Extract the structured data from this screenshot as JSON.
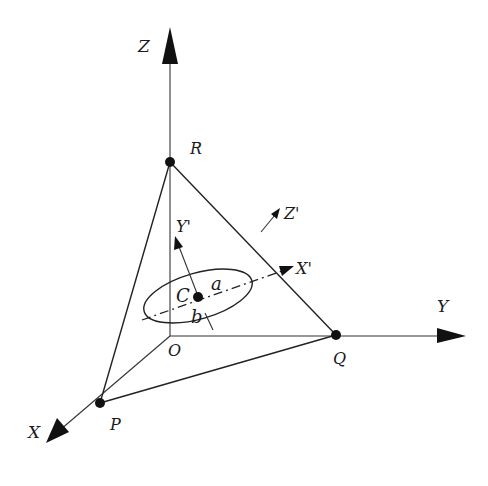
{
  "figure": {
    "axes": {
      "x": {
        "label": "X"
      },
      "y": {
        "label": "Y"
      },
      "z": {
        "label": "Z"
      }
    },
    "local_axes": {
      "x_prime": {
        "label": "X'"
      },
      "y_prime": {
        "label": "Y'"
      },
      "z_prime": {
        "label": "Z'"
      }
    },
    "points": {
      "origin": {
        "label": "O"
      },
      "p": {
        "label": "P"
      },
      "q": {
        "label": "Q"
      },
      "r": {
        "label": "R"
      },
      "c": {
        "label": "C"
      }
    },
    "ellipse": {
      "semi_major_label": "a",
      "semi_minor_label": "b"
    },
    "colors": {
      "ink": "#111111",
      "background": "#ffffff"
    }
  }
}
